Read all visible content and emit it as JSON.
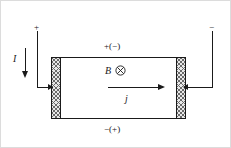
{
  "figure": {
    "width": 231,
    "height": 148,
    "background_color": "#ffffff",
    "line_color": "#1a1a1a",
    "electrode_fill_color": "#e8e8e8",
    "electrode_hatch_color": "#6a6a6a"
  },
  "terminals": {
    "left_sign": "+",
    "right_sign": "−"
  },
  "current": {
    "label": "I",
    "direction": "down",
    "arrow_icon": "down-arrow-icon"
  },
  "magnetic_field": {
    "label": "B",
    "direction": "into-page",
    "icon": "cross-in-circle-icon"
  },
  "current_density": {
    "label": "j",
    "direction": "right",
    "arrow_icon": "right-arrow-icon"
  },
  "hall_voltage": {
    "top_label": "+(−)",
    "bottom_label": "−(+)"
  },
  "electrodes": {
    "left_name": "left-electrode",
    "right_name": "right-electrode",
    "pattern": "cross-hatch"
  }
}
